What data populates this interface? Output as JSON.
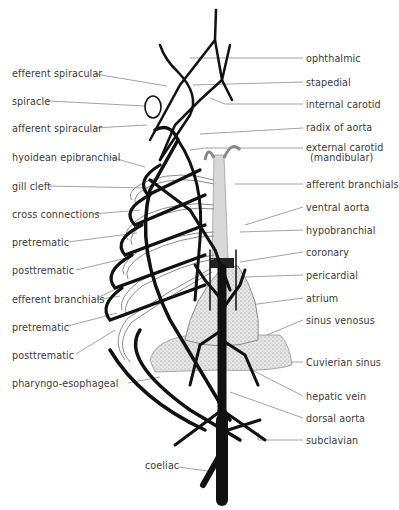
{
  "figure": {
    "left_labels": [
      {
        "text": "efferent spiracular",
        "x": 12,
        "y": 68
      },
      {
        "text": "spiracle",
        "x": 12,
        "y": 96
      },
      {
        "text": "afferent spiracular",
        "x": 12,
        "y": 123
      },
      {
        "text": "hyoidean epibranchial",
        "x": 12,
        "y": 152
      },
      {
        "text": "gill cleft",
        "x": 12,
        "y": 181
      },
      {
        "text": "cross connections",
        "x": 12,
        "y": 209
      },
      {
        "text": "pretrematic",
        "x": 12,
        "y": 237
      },
      {
        "text": "posttrematic",
        "x": 12,
        "y": 265
      },
      {
        "text": "efferent branchials",
        "x": 12,
        "y": 294
      },
      {
        "text": "pretrematic",
        "x": 12,
        "y": 322
      },
      {
        "text": "posttrematic",
        "x": 12,
        "y": 350
      },
      {
        "text": "pharyngo-esophageal",
        "x": 12,
        "y": 378
      }
    ],
    "right_labels": [
      {
        "text": "ophthalmic",
        "y": 55
      },
      {
        "text": "stapedial",
        "y": 78
      },
      {
        "text": "internal carotid",
        "y": 101
      },
      {
        "text": "radix of aorta",
        "y": 124
      },
      {
        "text": "external carotid",
        "line2": "(mandibular)",
        "y": 143
      },
      {
        "text": "afferent branchials",
        "y": 180
      },
      {
        "text": "ventral aorta",
        "y": 204
      },
      {
        "text": "hypobranchial",
        "y": 226
      },
      {
        "text": "coronary",
        "y": 249
      },
      {
        "text": "pericardial",
        "y": 271
      },
      {
        "text": "atrium",
        "y": 294
      },
      {
        "text": "sinus venosus",
        "y": 316
      },
      {
        "text": "Cuvierian sinus",
        "y": 359
      },
      {
        "text": "hepatic vein",
        "y": 393
      },
      {
        "text": "dorsal aorta",
        "y": 414
      },
      {
        "text": "subclavian",
        "y": 436
      }
    ],
    "bottom_labels": [
      {
        "text": "coeliac",
        "x": 145,
        "y": 461
      }
    ],
    "colors": {
      "vessel": "#111111",
      "afferent_vessel": "#9a9a9a",
      "heart_stipple": "#cfcfcf",
      "leader_line": "#7a7a7a"
    }
  }
}
